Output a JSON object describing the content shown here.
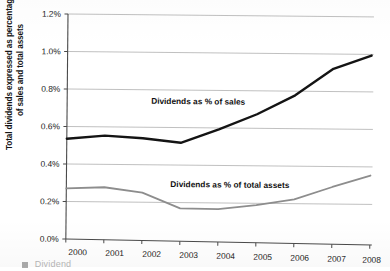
{
  "chart_data": {
    "type": "line",
    "title": "",
    "subtitle": "",
    "xlabel": "",
    "ylabel": "Total dividends expressed as percentages of sales and total assets",
    "ylabel_lines": [
      "Total dividends expressed as percentages",
      "of sales and total assets"
    ],
    "categories": [
      "2000",
      "2001",
      "2002",
      "2003",
      "2004",
      "2005",
      "2006",
      "2007",
      "2008"
    ],
    "x": [
      2000,
      2001,
      2002,
      2003,
      2004,
      2005,
      2006,
      2007,
      2008
    ],
    "ylim": [
      0.0,
      1.2
    ],
    "ytick_values": [
      0.0,
      0.2,
      0.4,
      0.6,
      0.8,
      1.0,
      1.2
    ],
    "ytick_labels": [
      "0.0%",
      "0.2%",
      "0.4%",
      "0.6%",
      "0.8%",
      "1.0%",
      "1.2%"
    ],
    "grid": true,
    "grid_axis": "y",
    "legend": "inline-annotations",
    "series": [
      {
        "name": "Dividends as % of sales",
        "color": "#141414",
        "width": 2.4,
        "values": [
          0.535,
          0.555,
          0.545,
          0.525,
          0.6,
          0.685,
          0.79,
          0.935,
          1.01
        ]
      },
      {
        "name": "Dividends as % of total assets",
        "color": "#8d8d8d",
        "width": 1.8,
        "values": [
          0.27,
          0.28,
          0.255,
          0.175,
          0.175,
          0.2,
          0.235,
          0.305,
          0.37
        ]
      }
    ],
    "annotations": [
      {
        "text": "Dividends as % of sales",
        "x_px": 152,
        "y_px": 102
      },
      {
        "text": "Dividends as % of total assets",
        "x_px": 172,
        "y_px": 185
      }
    ]
  },
  "axis": {
    "y_title_line1": "Total dividends expressed as percentages",
    "y_title_line2": "of sales and total assets",
    "y_ticks": [
      "1.2%",
      "1.0%",
      "0.8%",
      "0.6%",
      "0.4%",
      "0.2%",
      "0.0%"
    ],
    "x_ticks": [
      "2000",
      "2001",
      "2002",
      "2003",
      "2004",
      "2005",
      "2006",
      "2007",
      "2008"
    ]
  },
  "labels": {
    "series_sales": "Dividends as % of sales",
    "series_assets": "Dividends as % of total assets"
  },
  "caption": {
    "text": "Dividend"
  },
  "colors": {
    "series_sales": "#141414",
    "series_assets": "#8d8d8d",
    "gridline": "#b9b9b9",
    "axis": "#4a4a4a",
    "background": "#ffffff"
  }
}
